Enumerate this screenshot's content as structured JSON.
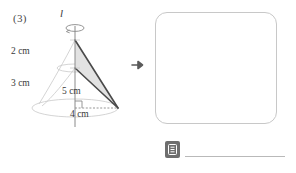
{
  "problem": {
    "number": "(3)",
    "axis_label": "l",
    "dimensions": [
      {
        "name": "upper-segment",
        "value": "2 cm"
      },
      {
        "name": "lower-segment",
        "value": "3 cm"
      },
      {
        "name": "slant-side",
        "value": "5 cm"
      },
      {
        "name": "base",
        "value": "4 cm"
      }
    ],
    "transform_arrow": "right-arrow",
    "answer_box": {
      "content": ""
    },
    "answer_row": {
      "icon": "note-icon",
      "line": ""
    }
  },
  "colors": {
    "ink": "#3a3a3a",
    "solid_stroke": "#4a4a4a",
    "faint_stroke": "#c9c9c9",
    "shade_fill": "#e2e2e2",
    "box_border": "#c8c8c8",
    "icon_bg": "#6e6e6e",
    "line": "#b9b9b9"
  }
}
